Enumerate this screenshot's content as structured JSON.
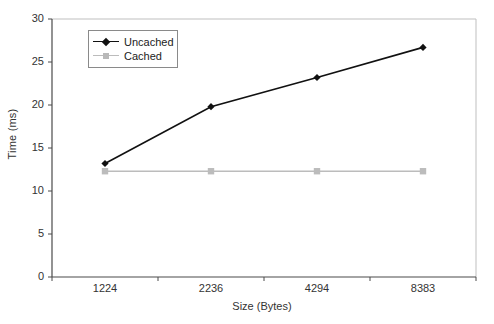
{
  "chart_data": {
    "type": "line",
    "title": "",
    "xlabel": "Size (Bytes)",
    "ylabel": "Time (ms)",
    "categories": [
      "1224",
      "2236",
      "4294",
      "8383"
    ],
    "ylim": [
      0,
      30
    ],
    "yticks": [
      "0",
      "5",
      "10",
      "15",
      "20",
      "25",
      "30"
    ],
    "grid": false,
    "legend_position": "top-left",
    "series": [
      {
        "name": "Uncached",
        "color": "#111111",
        "marker": "diamond",
        "values": [
          13.2,
          19.8,
          23.2,
          26.7
        ]
      },
      {
        "name": "Cached",
        "color": "#bcbcbc",
        "marker": "square",
        "values": [
          12.3,
          12.3,
          12.3,
          12.3
        ]
      }
    ]
  }
}
